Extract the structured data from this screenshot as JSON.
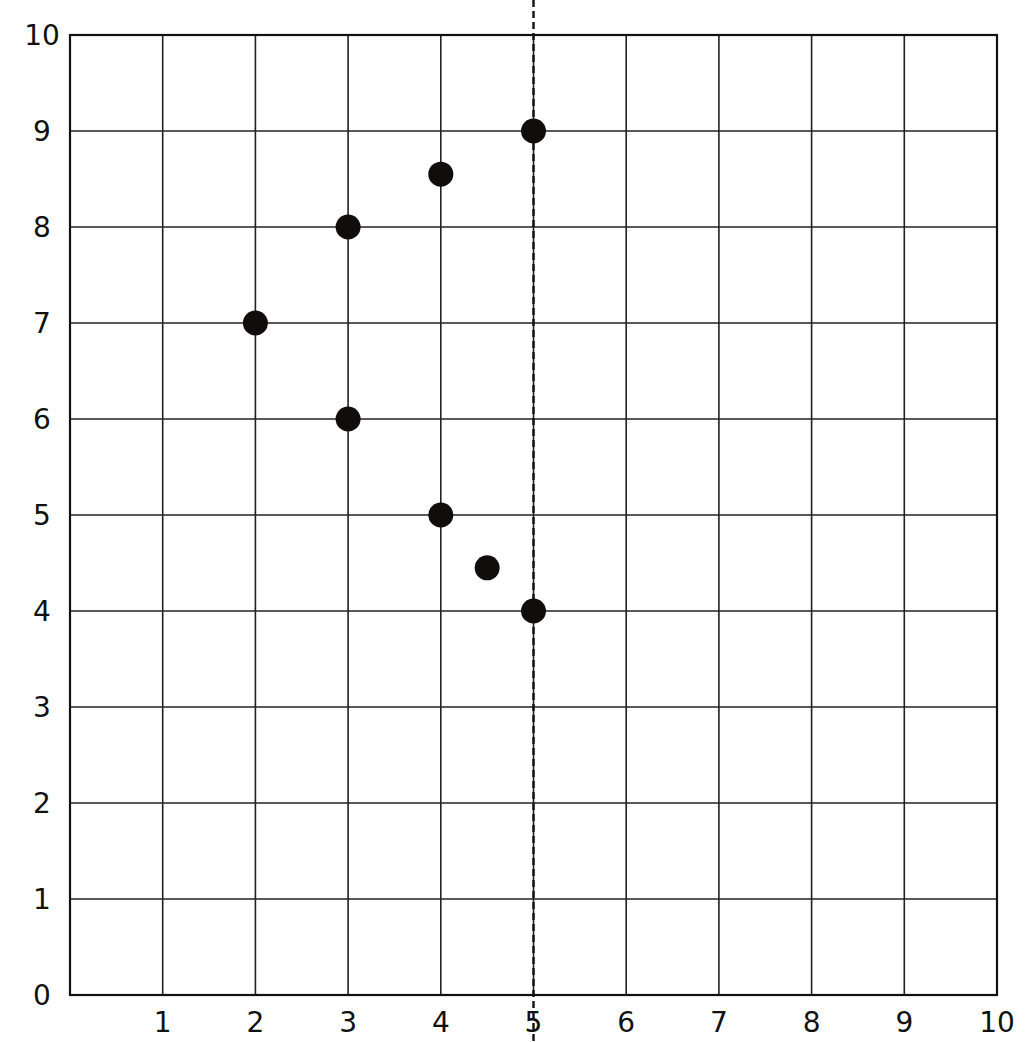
{
  "chart_data": {
    "type": "scatter",
    "title": "",
    "xlabel": "",
    "ylabel": "",
    "xlim": [
      0,
      10
    ],
    "ylim": [
      0,
      10
    ],
    "grid": true,
    "x_ticks": [
      "0",
      "1",
      "2",
      "3",
      "4",
      "5",
      "6",
      "7",
      "8",
      "9",
      "10"
    ],
    "y_ticks": [
      "0",
      "1",
      "2",
      "3",
      "4",
      "5",
      "6",
      "7",
      "8",
      "9",
      "10"
    ],
    "points": [
      {
        "x": 2,
        "y": 7
      },
      {
        "x": 3,
        "y": 8
      },
      {
        "x": 4,
        "y": 8.55
      },
      {
        "x": 5,
        "y": 9
      },
      {
        "x": 3,
        "y": 6
      },
      {
        "x": 4,
        "y": 5
      },
      {
        "x": 4.5,
        "y": 4.45
      },
      {
        "x": 5,
        "y": 4
      }
    ],
    "reference_line": {
      "orientation": "vertical",
      "x": 5,
      "style": "dashed"
    },
    "colors": {
      "point": "#120d0d",
      "grid": "#222222"
    }
  }
}
